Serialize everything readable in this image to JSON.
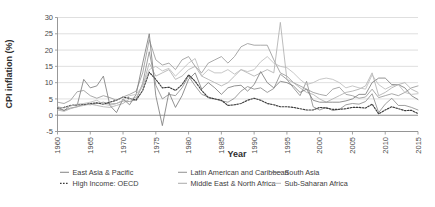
{
  "chart_data": {
    "type": "line",
    "title": "",
    "xlabel": "Year",
    "ylabel": "CPI inflation (%)",
    "xlim": [
      1960,
      2015
    ],
    "ylim": [
      -5,
      30
    ],
    "ytick_step": 5,
    "xtick_step": 5,
    "grid": true,
    "legend_position": "bottom",
    "xticks": [
      1960,
      1965,
      1970,
      1975,
      1980,
      1985,
      1990,
      1995,
      2000,
      2005,
      2010,
      2015
    ],
    "yticks": [
      -5,
      0,
      5,
      10,
      15,
      20,
      25,
      30
    ],
    "x": [
      1960,
      1961,
      1962,
      1963,
      1964,
      1965,
      1966,
      1967,
      1968,
      1969,
      1970,
      1971,
      1972,
      1973,
      1974,
      1975,
      1976,
      1977,
      1978,
      1979,
      1980,
      1981,
      1982,
      1983,
      1984,
      1985,
      1986,
      1987,
      1988,
      1989,
      1990,
      1991,
      1992,
      1993,
      1994,
      1995,
      1996,
      1997,
      1998,
      1999,
      2000,
      2001,
      2002,
      2003,
      2004,
      2005,
      2006,
      2007,
      2008,
      2009,
      2010,
      2011,
      2012,
      2013,
      2014,
      2015
    ],
    "series": [
      {
        "name": "East Asia & Pacific",
        "style": "solid",
        "color": "#8e8e8e",
        "values": [
          2.0,
          1.5,
          2.2,
          2.6,
          3.4,
          3.2,
          3.6,
          4.0,
          3.4,
          3.6,
          4.4,
          4.2,
          4.8,
          9.8,
          19.5,
          9.2,
          5.0,
          6.4,
          6.0,
          8.4,
          12.0,
          9.0,
          6.4,
          5.6,
          5.0,
          4.4,
          4.0,
          5.2,
          7.4,
          8.8,
          8.0,
          8.4,
          7.0,
          8.2,
          12.6,
          11.0,
          8.4,
          6.0,
          10.4,
          2.6,
          1.6,
          2.4,
          1.4,
          1.8,
          3.2,
          3.6,
          3.4,
          4.2,
          6.6,
          0.8,
          3.4,
          5.2,
          3.0,
          3.0,
          2.4,
          1.6
        ]
      },
      {
        "name": "High Income: OECD",
        "style": "dotted",
        "color": "#3c3c3c",
        "values": [
          2.2,
          2.4,
          3.0,
          3.2,
          3.2,
          3.6,
          3.8,
          3.4,
          4.0,
          4.6,
          5.6,
          5.2,
          4.6,
          7.6,
          13.2,
          11.0,
          8.4,
          8.6,
          7.6,
          9.4,
          12.4,
          10.4,
          7.6,
          5.4,
          5.0,
          4.6,
          3.0,
          3.2,
          3.6,
          4.6,
          5.2,
          4.6,
          3.6,
          3.2,
          2.6,
          2.6,
          2.4,
          2.0,
          1.6,
          1.6,
          2.4,
          2.2,
          1.8,
          1.8,
          2.0,
          2.4,
          2.4,
          2.2,
          3.4,
          0.4,
          1.6,
          2.6,
          2.0,
          1.4,
          1.5,
          0.5
        ]
      },
      {
        "name": "Latin American and Caribbean",
        "style": "solid",
        "color": "#9a9a9a",
        "values": [
          4.0,
          3.6,
          4.6,
          7.2,
          7.6,
          6.0,
          5.2,
          6.0,
          5.4,
          4.6,
          5.6,
          6.4,
          7.4,
          13.0,
          23.2,
          17.0,
          15.4,
          16.0,
          14.0,
          17.0,
          18.0,
          15.0,
          13.0,
          16.0,
          17.0,
          18.0,
          16.0,
          18.0,
          21.0,
          22.0,
          21.5,
          21.5,
          21.5,
          17.0,
          13.0,
          12.0,
          10.0,
          9.0,
          8.0,
          7.0,
          6.4,
          6.0,
          8.0,
          8.6,
          6.4,
          6.0,
          5.2,
          5.6,
          8.0,
          5.4,
          6.0,
          6.6,
          6.0,
          7.0,
          8.4,
          9.0
        ]
      },
      {
        "name": "Middle East & North Africa",
        "style": "solid",
        "color": "#b0b0b0",
        "values": [
          1.6,
          1.2,
          2.0,
          2.6,
          3.0,
          3.4,
          3.0,
          2.6,
          2.4,
          3.0,
          3.6,
          5.0,
          5.4,
          9.0,
          16.0,
          12.0,
          13.0,
          14.0,
          11.0,
          12.0,
          14.0,
          15.0,
          12.0,
          11.0,
          10.0,
          9.0,
          10.0,
          12.0,
          14.0,
          13.0,
          12.0,
          13.0,
          14.0,
          13.0,
          28.5,
          11.0,
          10.0,
          8.4,
          7.0,
          6.4,
          5.0,
          4.0,
          5.0,
          6.0,
          7.0,
          7.4,
          8.0,
          9.0,
          13.0,
          6.0,
          7.0,
          8.4,
          9.4,
          10.0,
          8.0,
          7.0
        ]
      },
      {
        "name": "South Asia",
        "style": "solid",
        "color": "#7e7e7e",
        "values": [
          2.6,
          1.4,
          3.0,
          3.0,
          11.0,
          8.4,
          9.0,
          12.0,
          3.0,
          0.8,
          5.0,
          3.2,
          6.4,
          16.0,
          25.0,
          6.0,
          -3.2,
          7.0,
          2.4,
          6.0,
          11.0,
          13.0,
          8.0,
          10.0,
          8.4,
          6.4,
          8.4,
          9.0,
          9.2,
          7.4,
          9.4,
          13.4,
          10.0,
          8.4,
          10.4,
          10.0,
          9.0,
          7.0,
          8.0,
          4.6,
          4.0,
          4.0,
          4.0,
          4.0,
          4.4,
          5.0,
          6.4,
          6.4,
          10.0,
          11.4,
          11.4,
          9.4,
          9.4,
          8.4,
          6.0,
          4.8
        ]
      },
      {
        "name": "Sub-Saharan Africa",
        "style": "solid",
        "color": "#bdbdbd",
        "values": [
          2.6,
          2.2,
          2.8,
          3.4,
          3.6,
          4.0,
          4.6,
          3.4,
          3.0,
          3.6,
          4.6,
          6.0,
          6.4,
          9.0,
          14.0,
          15.0,
          13.6,
          14.4,
          12.0,
          14.0,
          16.0,
          17.4,
          12.0,
          14.0,
          13.0,
          13.0,
          14.0,
          12.6,
          14.0,
          13.4,
          14.0,
          16.4,
          18.0,
          16.0,
          15.0,
          14.6,
          13.0,
          11.0,
          9.4,
          10.0,
          11.0,
          11.4,
          11.0,
          10.0,
          8.4,
          9.0,
          8.4,
          8.0,
          12.4,
          9.4,
          8.0,
          9.0,
          9.4,
          7.0,
          6.4,
          6.6
        ]
      }
    ]
  },
  "legend": {
    "entries": [
      {
        "label": "East Asia & Pacific",
        "style": "solid",
        "color": "#8e8e8e"
      },
      {
        "label": "High Income: OECD",
        "style": "dotted",
        "color": "#3c3c3c"
      },
      {
        "label": "Latin American and Caribbean",
        "style": "solid",
        "color": "#9a9a9a"
      },
      {
        "label": "Middle East & North Africa",
        "style": "solid",
        "color": "#b0b0b0"
      },
      {
        "label": "South Asia",
        "style": "solid",
        "color": "#7e7e7e"
      },
      {
        "label": "Sub-Saharan Africa",
        "style": "solid",
        "color": "#bdbdbd"
      }
    ]
  }
}
